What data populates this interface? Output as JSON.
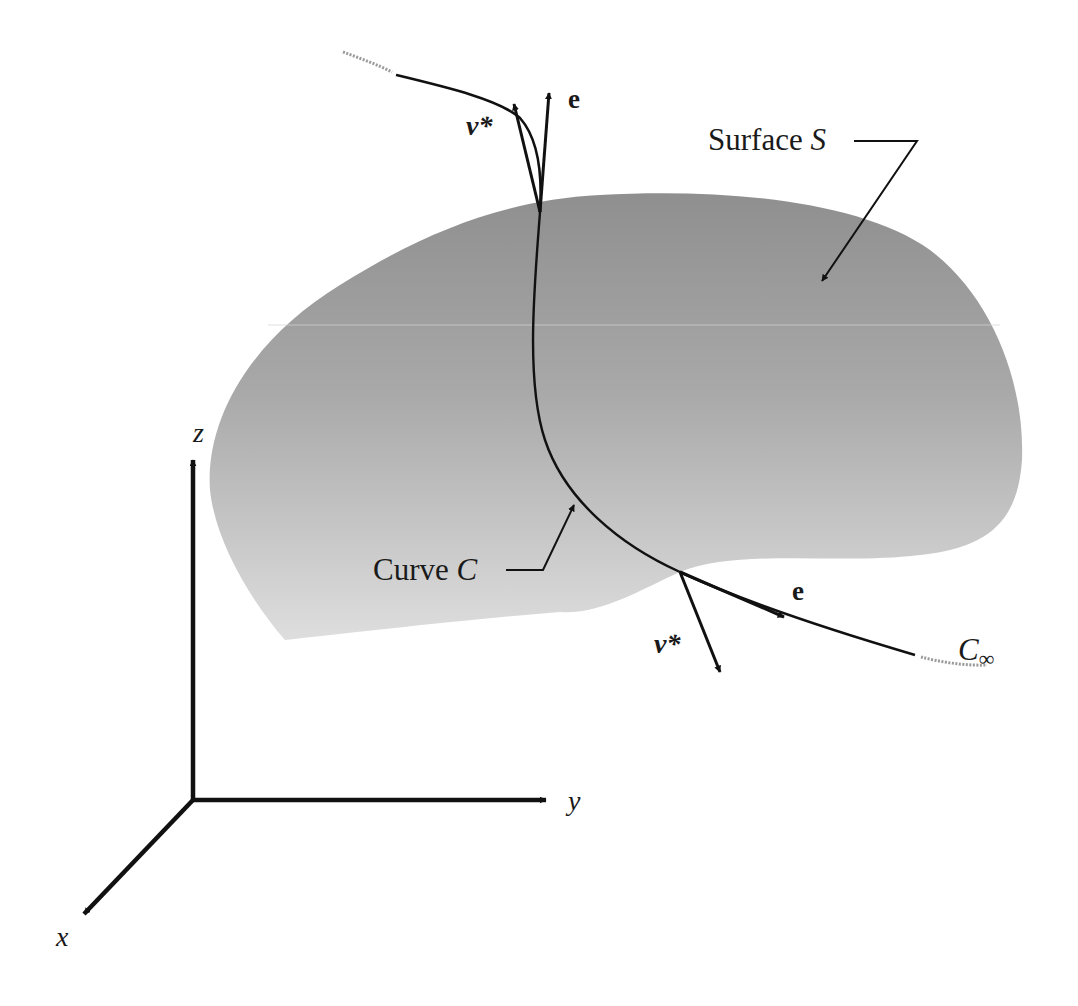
{
  "figure": {
    "type": "3d-surface-diagram",
    "colors": {
      "surface_top": "#8f8f8f",
      "surface_bottom": "#dadada",
      "stroke": "#111111",
      "faint_tail": "#9a9a9a",
      "background": "#ffffff"
    },
    "labels": {
      "surface": "Surface ",
      "surface_symbol": "S",
      "curve": "Curve ",
      "curve_symbol": "C",
      "c_inf_base": "C",
      "c_inf_sub": "∞",
      "e_top": "e",
      "nu_top": "ν*",
      "e_bottom": "e",
      "nu_bottom": "ν*"
    },
    "axes": {
      "x": "x",
      "y": "y",
      "z": "z"
    }
  }
}
